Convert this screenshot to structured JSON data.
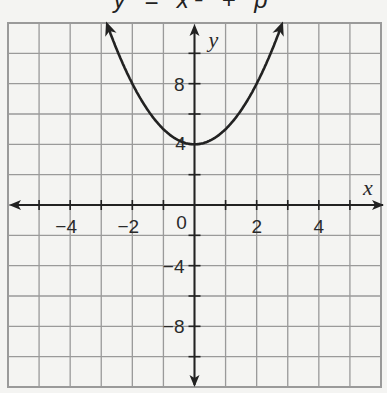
{
  "title": "y = x² + p",
  "chart_data": {
    "type": "line",
    "title": "y = x² + p",
    "function": "y = x^2 + 4",
    "xlabel": "x",
    "ylabel": "y",
    "xlim": [
      -6,
      6
    ],
    "ylim": [
      -12,
      12
    ],
    "grid": true,
    "grid_step_x": 1,
    "grid_step_y": 2,
    "x_tick_labels": [
      "-4",
      "-2",
      "0",
      "2",
      "4"
    ],
    "y_tick_labels": [
      "8",
      "4",
      "-4",
      "-8"
    ],
    "vertex": [
      0,
      4
    ],
    "x": [
      -2.83,
      -2,
      -1,
      0,
      1,
      2,
      2.83
    ],
    "values": [
      12,
      8,
      5,
      4,
      5,
      8,
      12
    ]
  },
  "axes": {
    "x_label": "x",
    "y_label": "y",
    "x_ticks": [
      {
        "v": -4,
        "t": "−4"
      },
      {
        "v": -2,
        "t": "−2"
      },
      {
        "v": 2,
        "t": "2"
      },
      {
        "v": 4,
        "t": "4"
      }
    ],
    "origin_label": "0",
    "y_ticks": [
      {
        "v": 8,
        "t": "8"
      },
      {
        "v": 4,
        "t": "4"
      },
      {
        "v": -4,
        "t": "−4"
      },
      {
        "v": -8,
        "t": "−8"
      }
    ]
  },
  "colors": {
    "grid": "#9a9a9a",
    "curve": "#222222",
    "axis": "#222222",
    "paper": "#f4f4f2"
  }
}
